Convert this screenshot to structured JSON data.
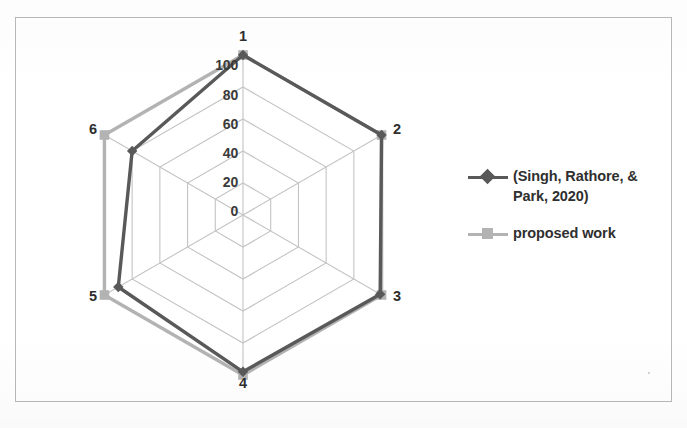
{
  "chart_data": {
    "type": "radar",
    "title": "",
    "subtitle": "",
    "xlabel": "",
    "ylabel": "",
    "categories": [
      "1",
      "2",
      "3",
      "4",
      "5",
      "6"
    ],
    "tick_labels": [
      "0",
      "20",
      "40",
      "60",
      "80",
      "100"
    ],
    "tick_values": [
      0,
      20,
      40,
      60,
      80,
      100
    ],
    "rlim": [
      0,
      100
    ],
    "grid": true,
    "grid_shape": "polygon",
    "legend_position": "right",
    "series": [
      {
        "name": "(Singh, Rathore, & Park, 2020)",
        "color": "#595959",
        "marker": "diamond",
        "values": [
          100,
          100,
          99,
          98,
          90,
          80
        ]
      },
      {
        "name": "proposed work",
        "color": "#b3b3b3",
        "marker": "square",
        "values": [
          100,
          100,
          100,
          100,
          100,
          100
        ]
      }
    ]
  },
  "legend": {
    "entries": [
      {
        "label": "(Singh, Rathore, & Park, 2020)",
        "marker": "diamond-marker",
        "color": "#595959"
      },
      {
        "label": "proposed work",
        "marker": "square-marker",
        "color": "#b3b3b3"
      }
    ]
  },
  "axis": {
    "tick_0": "0",
    "tick_20": "20",
    "tick_40": "40",
    "tick_60": "60",
    "tick_80": "80",
    "tick_100": "100"
  },
  "vertices": {
    "v1": "1",
    "v2": "2",
    "v3": "3",
    "v4": "4",
    "v5": "5",
    "v6": "6"
  },
  "colors": {
    "series_dark": "#595959",
    "series_light": "#b3b3b3",
    "grid": "#c4c4c6",
    "frame": "#b9b9bb",
    "background": "#ffffff",
    "text": "#2f2f2f"
  }
}
